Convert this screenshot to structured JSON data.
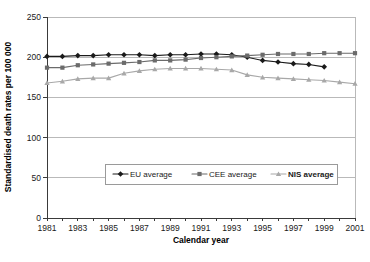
{
  "chart_data": {
    "type": "line",
    "title": "",
    "xlabel": "Calendar year",
    "ylabel": "Standardised death rates per 100 000",
    "xlim": [
      1981,
      2001
    ],
    "ylim": [
      0,
      250
    ],
    "ytick_step": 50,
    "xtick_step": 2,
    "grid": true,
    "legend_position": "inside-lower-center",
    "yticks": [
      "0",
      "50",
      "100",
      "150",
      "200",
      "250"
    ],
    "ytick_values": [
      0,
      50,
      100,
      150,
      200,
      250
    ],
    "xticks": [
      "1981",
      "1983",
      "1985",
      "1987",
      "1989",
      "1991",
      "1993",
      "1995",
      "1997",
      "1999",
      "2001"
    ],
    "xtick_values": [
      1981,
      1983,
      1985,
      1987,
      1989,
      1991,
      1993,
      1995,
      1997,
      1999,
      2001
    ],
    "x": [
      1981,
      1982,
      1983,
      1984,
      1985,
      1986,
      1987,
      1988,
      1989,
      1990,
      1991,
      1992,
      1993,
      1994,
      1995,
      1996,
      1997,
      1998,
      1999,
      2000,
      2001
    ],
    "series": [
      {
        "name": "EU average",
        "marker": "diamond",
        "color": "#1a1a1a",
        "x": [
          1981,
          1982,
          1983,
          1984,
          1985,
          1986,
          1987,
          1988,
          1989,
          1990,
          1991,
          1992,
          1993,
          1994,
          1995,
          1996,
          1997,
          1998,
          1999
        ],
        "values": [
          201,
          201,
          202,
          202,
          203,
          203,
          203,
          202,
          203,
          203,
          204,
          204,
          203,
          200,
          196,
          194,
          192,
          191,
          188
        ]
      },
      {
        "name": "CEE average",
        "marker": "square",
        "color": "#6b6b6b",
        "x": [
          1981,
          1982,
          1983,
          1984,
          1985,
          1986,
          1987,
          1988,
          1989,
          1990,
          1991,
          1992,
          1993,
          1994,
          1995,
          1996,
          1997,
          1998,
          1999,
          2000,
          2001
        ],
        "values": [
          187,
          187,
          190,
          191,
          192,
          193,
          194,
          196,
          196,
          197,
          199,
          200,
          201,
          202,
          203,
          204,
          204,
          204,
          205,
          205,
          205
        ]
      },
      {
        "name": "NIS average",
        "marker": "triangle",
        "color": "#a8a8a8",
        "x": [
          1981,
          1982,
          1983,
          1984,
          1985,
          1986,
          1987,
          1988,
          1989,
          1990,
          1991,
          1992,
          1993,
          1994,
          1995,
          1996,
          1997,
          1998,
          1999,
          2000,
          2001
        ],
        "values": [
          168,
          170,
          173,
          174,
          174,
          180,
          183,
          185,
          186,
          186,
          186,
          185,
          184,
          178,
          175,
          174,
          173,
          172,
          171,
          169,
          167
        ]
      }
    ]
  },
  "legend": {
    "items": [
      {
        "label": "EU average",
        "bold": false
      },
      {
        "label": "CEE average",
        "bold": false
      },
      {
        "label": "NIS average",
        "bold": true
      }
    ]
  }
}
